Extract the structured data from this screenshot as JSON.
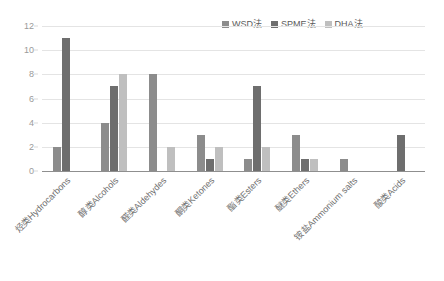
{
  "chart_data": {
    "type": "bar",
    "title": "",
    "subtitle": "",
    "xlabel": "",
    "ylabel": "",
    "ylim": [
      0,
      12
    ],
    "yticks": [
      0,
      2,
      4,
      6,
      8,
      10,
      12
    ],
    "grid": true,
    "legend_position": "top-right",
    "orientation": "vertical-grouped",
    "categories": [
      "烃类Hydrocarbons",
      "醇类Alcohols",
      "醛类Aldehydes",
      "酮类Ketones",
      "酯类Esters",
      "醚类Ethers",
      "铵盐Ammonium salts",
      "酸类Acids"
    ],
    "series": [
      {
        "name": "WSD法",
        "color": "#8c8c8c",
        "values": [
          2,
          4,
          8,
          3,
          1,
          3,
          1,
          0
        ]
      },
      {
        "name": "SPME法",
        "color": "#6e6e6e",
        "values": [
          11,
          7,
          0,
          1,
          7,
          1,
          0,
          3
        ]
      },
      {
        "name": "DHA法",
        "color": "#bfbfbf",
        "values": [
          0,
          8,
          2,
          2,
          2,
          1,
          0,
          0
        ]
      }
    ]
  },
  "axes": {
    "gridline_color": "#e4e4e4",
    "baseline_color": "#8f8f8f",
    "tick_label_color": "#9a9a9a",
    "category_label_color": "#6f6f6f"
  },
  "legend": {
    "items": [
      {
        "label": "WSD法",
        "color": "#8c8c8c"
      },
      {
        "label": "SPME法",
        "color": "#6e6e6e"
      },
      {
        "label": "DHA法",
        "color": "#bfbfbf"
      }
    ]
  }
}
